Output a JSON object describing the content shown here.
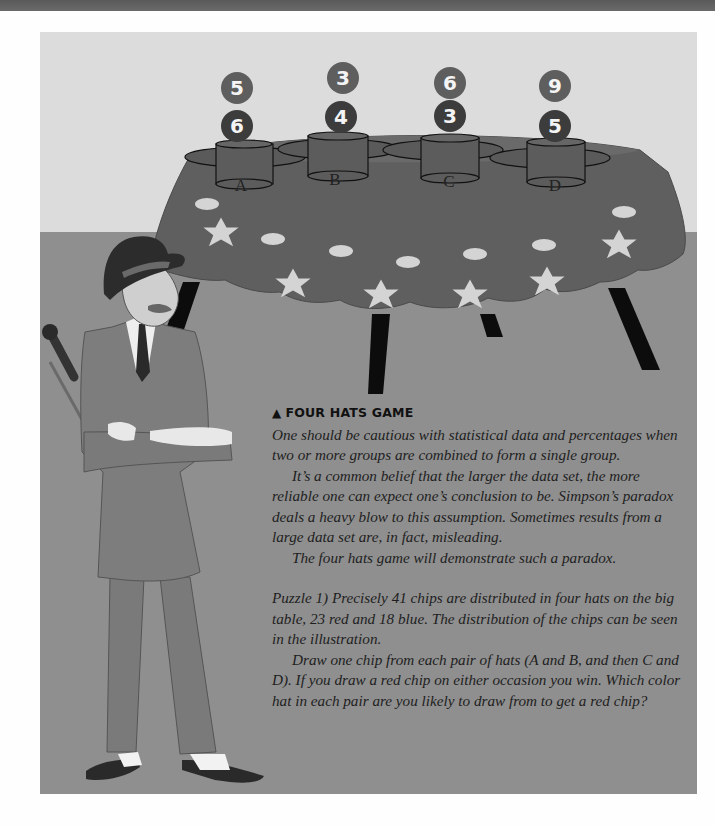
{
  "page": {
    "heading_marker": "▲",
    "heading": "FOUR HATS GAME",
    "paragraphs": [
      "One should be cautious with statistical data and percentages when two or more groups are combined to form a single group.",
      "It’s a common belief that the larger the data set, the more reliable one can expect one’s conclusion to be. Simpson’s paradox deals a heavy blow to this assumption. Sometimes results from a large data set are, in fact, misleading.",
      "The four hats game will demonstrate such a paradox.",
      "Puzzle 1) Precisely 41 chips are distributed in four hats on the big table, 23 red and 18 blue. The distribution of the chips can be seen in the illustration.",
      "Draw one chip from each pair of hats (A and B, and then C and D). If you draw a red chip on either occasion you win. Which color hat in each pair are you likely to draw from to get a red chip?"
    ]
  },
  "illustration": {
    "hats": [
      {
        "label": "A",
        "red_chips": "5",
        "blue_chips": "6"
      },
      {
        "label": "B",
        "red_chips": "3",
        "blue_chips": "4"
      },
      {
        "label": "C",
        "red_chips": "6",
        "blue_chips": "3"
      },
      {
        "label": "D",
        "red_chips": "9",
        "blue_chips": "5"
      }
    ],
    "totals": {
      "chips": "41",
      "red": "23",
      "blue": "18"
    },
    "colors": {
      "wall": "#dcdcdc",
      "floor": "#8f8f8f",
      "tablecloth": "#5f5f5f",
      "red_chip": "#5e5e5e",
      "blue_chip": "#3c3c3c"
    }
  }
}
